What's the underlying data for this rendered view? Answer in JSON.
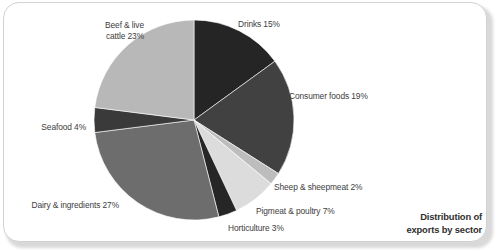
{
  "card": {
    "title_line1": "Distribution of",
    "title_line2": "exports by sector"
  },
  "chart_data": {
    "type": "pie",
    "title": "Distribution of exports by sector",
    "xlabel": "",
    "ylabel": "",
    "legend_position": "none",
    "grid": false,
    "units": "percent",
    "start_angle_deg": 0,
    "direction": "clockwise",
    "center": {
      "x": 194,
      "y": 120
    },
    "radius": 100,
    "categories": [
      "Drinks",
      "Consumer foods",
      "Sheep & sheepmeat",
      "Pigmeat & poultry",
      "Horticulture",
      "Dairy & ingredients",
      "Seafood",
      "Beef & live cattle"
    ],
    "values": [
      15,
      19,
      2,
      7,
      3,
      27,
      4,
      23
    ],
    "slices": [
      {
        "label": "Drinks 15%",
        "name": "Drinks",
        "value": 15,
        "color": "#252525",
        "label_x": 238,
        "label_y": 19,
        "align": "right",
        "lines": [
          "Drinks 15%"
        ]
      },
      {
        "label": "Consumer foods 19%",
        "name": "Consumer foods",
        "value": 19,
        "color": "#414141",
        "label_x": 289,
        "label_y": 91,
        "align": "right",
        "lines": [
          "Consumer foods 19%"
        ]
      },
      {
        "label": "Sheep & sheepmeat 2%",
        "name": "Sheep & sheepmeat",
        "value": 2,
        "color": "#bdbdbd",
        "label_x": 274,
        "label_y": 182,
        "align": "right",
        "lines": [
          "Sheep & sheepmeat 2%"
        ]
      },
      {
        "label": "Pigmeat & poultry 7%",
        "name": "Pigmeat & poultry",
        "value": 7,
        "color": "#dcdcdc",
        "label_x": 256,
        "label_y": 206,
        "align": "right",
        "lines": [
          "Pigmeat & poultry 7%"
        ]
      },
      {
        "label": "Horticulture 3%",
        "name": "Horticulture",
        "value": 3,
        "color": "#262626",
        "label_x": 228,
        "label_y": 223,
        "align": "right",
        "lines": [
          "Horticulture 3%"
        ]
      },
      {
        "label": "Dairy & ingredients 27%",
        "name": "Dairy & ingredients",
        "value": 27,
        "color": "#6d6d6d",
        "label_x": 119,
        "label_y": 200,
        "align": "left",
        "lines": [
          "Dairy & ingredients 27%"
        ]
      },
      {
        "label": "Seafood 4%",
        "name": "Seafood",
        "value": 4,
        "color": "#3a3a3a",
        "label_x": 86,
        "label_y": 122,
        "align": "left",
        "lines": [
          "Seafood 4%"
        ]
      },
      {
        "label": "Beef & live cattle 23%",
        "name": "Beef & live cattle",
        "value": 23,
        "color": "#b8b8b8",
        "label_x": 144,
        "label_y": 20,
        "align": "left",
        "lines": [
          "Beef & live",
          "cattle 23%"
        ]
      }
    ]
  }
}
